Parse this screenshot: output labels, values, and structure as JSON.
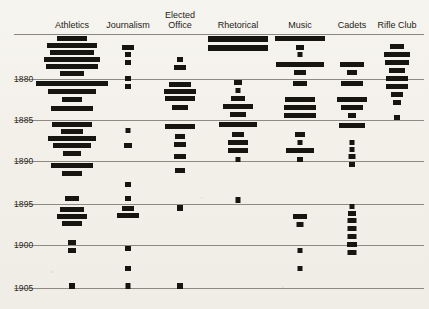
{
  "figure": {
    "background_color": "#f2f0ea",
    "ink_color": "#17150f",
    "grid_color": "#8d8a82"
  },
  "axis": {
    "year_labels": [
      "1880",
      "1885",
      "1890",
      "1895",
      "1900",
      "1905"
    ],
    "year_label_y": [
      74,
      115,
      156,
      199,
      240,
      283
    ],
    "gridline_y": [
      34,
      79,
      120,
      161,
      204,
      245,
      288
    ],
    "top_axis_y": 34
  },
  "columns": [
    {
      "name": "athletics",
      "label": "Athletics",
      "center_x": 72,
      "label_lines": [
        "Athletics"
      ],
      "label_y": 20
    },
    {
      "name": "journalism",
      "label": "Journalism",
      "center_x": 128,
      "label_lines": [
        "Journalism"
      ],
      "label_y": 20
    },
    {
      "name": "elected-office",
      "label": "Elected Office",
      "center_x": 180,
      "label_lines": [
        "Elected",
        "Office"
      ],
      "label_y": 10
    },
    {
      "name": "rhetorical",
      "label": "Rhetorical",
      "center_x": 238,
      "label_lines": [
        "Rhetorical"
      ],
      "label_y": 20
    },
    {
      "name": "music",
      "label": "Music",
      "center_x": 300,
      "label_lines": [
        "Music"
      ],
      "label_y": 20
    },
    {
      "name": "cadets",
      "label": "Cadets",
      "center_x": 352,
      "label_lines": [
        "Cadets"
      ],
      "label_y": 20
    },
    {
      "name": "rifle-club",
      "label": "Rifle Club",
      "center_x": 397,
      "label_lines": [
        "Rifle Club"
      ],
      "label_y": 20
    }
  ],
  "chart_data": {
    "type": "bar",
    "title": "",
    "subtitle": "",
    "xlabel": "",
    "ylabel": "",
    "orientation": "horizontal-centered",
    "grid": true,
    "legend": false,
    "ylim": [
      1876,
      1906
    ],
    "ytick_labels": [
      "1880",
      "1885",
      "1890",
      "1895",
      "1900",
      "1905"
    ],
    "ytick_values": [
      1880,
      1885,
      1890,
      1895,
      1900,
      1905
    ],
    "categories": [
      "Athletics",
      "Journalism",
      "Elected Office",
      "Rhetorical",
      "Music",
      "Cadets",
      "Rifle Club"
    ],
    "series": [
      {
        "name": "Athletics",
        "bars": [
          {
            "y": 36,
            "w": 30,
            "h": 5
          },
          {
            "y": 43,
            "w": 50,
            "h": 5
          },
          {
            "y": 50,
            "w": 44,
            "h": 5
          },
          {
            "y": 57,
            "w": 56,
            "h": 5
          },
          {
            "y": 64,
            "w": 52,
            "h": 5
          },
          {
            "y": 71,
            "w": 24,
            "h": 5
          },
          {
            "y": 81,
            "w": 72,
            "h": 5
          },
          {
            "y": 89,
            "w": 48,
            "h": 5
          },
          {
            "y": 97,
            "w": 20,
            "h": 5
          },
          {
            "y": 106,
            "w": 42,
            "h": 5
          },
          {
            "y": 122,
            "w": 40,
            "h": 5
          },
          {
            "y": 129,
            "w": 22,
            "h": 5
          },
          {
            "y": 136,
            "w": 48,
            "h": 5
          },
          {
            "y": 143,
            "w": 38,
            "h": 5
          },
          {
            "y": 151,
            "w": 18,
            "h": 5
          },
          {
            "y": 163,
            "w": 42,
            "h": 5
          },
          {
            "y": 171,
            "w": 20,
            "h": 5
          },
          {
            "y": 196,
            "w": 14,
            "h": 5
          },
          {
            "y": 207,
            "w": 24,
            "h": 5
          },
          {
            "y": 214,
            "w": 30,
            "h": 5
          },
          {
            "y": 221,
            "w": 20,
            "h": 5
          },
          {
            "y": 240,
            "w": 8,
            "h": 5
          },
          {
            "y": 248,
            "w": 8,
            "h": 5
          },
          {
            "y": 283,
            "w": 6,
            "h": 6
          }
        ]
      },
      {
        "name": "Journalism",
        "bars": [
          {
            "y": 45,
            "w": 12,
            "h": 5
          },
          {
            "y": 52,
            "w": 6,
            "h": 5
          },
          {
            "y": 60,
            "w": 6,
            "h": 5
          },
          {
            "y": 76,
            "w": 6,
            "h": 5
          },
          {
            "y": 84,
            "w": 6,
            "h": 5
          },
          {
            "y": 128,
            "w": 5,
            "h": 5
          },
          {
            "y": 143,
            "w": 8,
            "h": 5
          },
          {
            "y": 182,
            "w": 6,
            "h": 5
          },
          {
            "y": 196,
            "w": 6,
            "h": 5
          },
          {
            "y": 206,
            "w": 12,
            "h": 5
          },
          {
            "y": 213,
            "w": 22,
            "h": 5
          },
          {
            "y": 246,
            "w": 6,
            "h": 5
          },
          {
            "y": 266,
            "w": 6,
            "h": 5
          },
          {
            "y": 283,
            "w": 5,
            "h": 6
          }
        ]
      },
      {
        "name": "Elected Office",
        "bars": [
          {
            "y": 57,
            "w": 6,
            "h": 5
          },
          {
            "y": 65,
            "w": 12,
            "h": 5
          },
          {
            "y": 82,
            "w": 22,
            "h": 5
          },
          {
            "y": 89,
            "w": 32,
            "h": 5
          },
          {
            "y": 96,
            "w": 30,
            "h": 5
          },
          {
            "y": 105,
            "w": 16,
            "h": 5
          },
          {
            "y": 124,
            "w": 30,
            "h": 5
          },
          {
            "y": 134,
            "w": 10,
            "h": 5
          },
          {
            "y": 142,
            "w": 12,
            "h": 5
          },
          {
            "y": 154,
            "w": 12,
            "h": 5
          },
          {
            "y": 168,
            "w": 10,
            "h": 5
          },
          {
            "y": 205,
            "w": 6,
            "h": 6
          },
          {
            "y": 283,
            "w": 6,
            "h": 6
          }
        ]
      },
      {
        "name": "Rhetorical",
        "bars": [
          {
            "y": 36,
            "w": 60,
            "h": 6
          },
          {
            "y": 45,
            "w": 60,
            "h": 6
          },
          {
            "y": 80,
            "w": 8,
            "h": 5
          },
          {
            "y": 88,
            "w": 5,
            "h": 5
          },
          {
            "y": 96,
            "w": 14,
            "h": 5
          },
          {
            "y": 104,
            "w": 30,
            "h": 5
          },
          {
            "y": 112,
            "w": 16,
            "h": 5
          },
          {
            "y": 122,
            "w": 38,
            "h": 5
          },
          {
            "y": 132,
            "w": 12,
            "h": 5
          },
          {
            "y": 140,
            "w": 20,
            "h": 5
          },
          {
            "y": 148,
            "w": 20,
            "h": 5
          },
          {
            "y": 157,
            "w": 5,
            "h": 5
          },
          {
            "y": 197,
            "w": 5,
            "h": 6
          }
        ]
      },
      {
        "name": "Music",
        "bars": [
          {
            "y": 36,
            "w": 50,
            "h": 5
          },
          {
            "y": 45,
            "w": 8,
            "h": 5
          },
          {
            "y": 52,
            "w": 5,
            "h": 5
          },
          {
            "y": 62,
            "w": 48,
            "h": 5
          },
          {
            "y": 70,
            "w": 12,
            "h": 5
          },
          {
            "y": 81,
            "w": 14,
            "h": 5
          },
          {
            "y": 97,
            "w": 30,
            "h": 5
          },
          {
            "y": 105,
            "w": 32,
            "h": 5
          },
          {
            "y": 113,
            "w": 32,
            "h": 5
          },
          {
            "y": 132,
            "w": 10,
            "h": 5
          },
          {
            "y": 140,
            "w": 5,
            "h": 5
          },
          {
            "y": 148,
            "w": 28,
            "h": 5
          },
          {
            "y": 157,
            "w": 6,
            "h": 5
          },
          {
            "y": 214,
            "w": 14,
            "h": 5
          },
          {
            "y": 222,
            "w": 7,
            "h": 5
          },
          {
            "y": 248,
            "w": 5,
            "h": 5
          },
          {
            "y": 266,
            "w": 5,
            "h": 5
          }
        ]
      },
      {
        "name": "Cadets",
        "bars": [
          {
            "y": 62,
            "w": 24,
            "h": 5
          },
          {
            "y": 70,
            "w": 10,
            "h": 5
          },
          {
            "y": 81,
            "w": 22,
            "h": 5
          },
          {
            "y": 97,
            "w": 30,
            "h": 5
          },
          {
            "y": 105,
            "w": 22,
            "h": 5
          },
          {
            "y": 113,
            "w": 8,
            "h": 5
          },
          {
            "y": 123,
            "w": 26,
            "h": 5
          },
          {
            "y": 140,
            "w": 5,
            "h": 5
          },
          {
            "y": 147,
            "w": 5,
            "h": 5
          },
          {
            "y": 154,
            "w": 7,
            "h": 5
          },
          {
            "y": 162,
            "w": 6,
            "h": 5
          },
          {
            "y": 204,
            "w": 5,
            "h": 5
          },
          {
            "y": 211,
            "w": 8,
            "h": 5
          },
          {
            "y": 218,
            "w": 9,
            "h": 5
          },
          {
            "y": 226,
            "w": 9,
            "h": 5
          },
          {
            "y": 234,
            "w": 9,
            "h": 5
          },
          {
            "y": 242,
            "w": 10,
            "h": 5
          },
          {
            "y": 250,
            "w": 9,
            "h": 5
          }
        ]
      },
      {
        "name": "Rifle Club",
        "bars": [
          {
            "y": 44,
            "w": 14,
            "h": 5
          },
          {
            "y": 52,
            "w": 26,
            "h": 5
          },
          {
            "y": 60,
            "w": 24,
            "h": 5
          },
          {
            "y": 68,
            "w": 16,
            "h": 5
          },
          {
            "y": 76,
            "w": 22,
            "h": 5
          },
          {
            "y": 84,
            "w": 22,
            "h": 5
          },
          {
            "y": 92,
            "w": 12,
            "h": 5
          },
          {
            "y": 100,
            "w": 8,
            "h": 5
          },
          {
            "y": 115,
            "w": 6,
            "h": 5
          }
        ]
      }
    ]
  }
}
